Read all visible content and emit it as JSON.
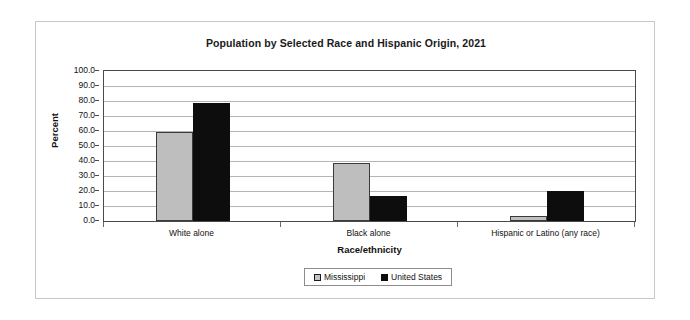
{
  "chart_data": {
    "type": "bar",
    "title": "Population by Selected Race and Hispanic Origin, 2021",
    "xlabel": "Race/ethnicity",
    "ylabel": "Percent",
    "ylim": [
      0.0,
      100.0
    ],
    "ytick_step": 10.0,
    "ytick_labels": [
      "100.0",
      "90.0",
      "80.0",
      "70.0",
      "60.0",
      "50.0",
      "40.0",
      "30.0",
      "20.0",
      "10.0",
      "0.0"
    ],
    "ytick_values": [
      100.0,
      90.0,
      80.0,
      70.0,
      60.0,
      50.0,
      40.0,
      30.0,
      20.0,
      10.0,
      0.0
    ],
    "grid": true,
    "legend_position": "bottom-center",
    "categories": [
      "White alone",
      "Black alone",
      "Hispanic or Latino (any race)"
    ],
    "series": [
      {
        "name": "Mississippi",
        "color": "#bebebe",
        "values": [
          59.1,
          38.8,
          3.6
        ]
      },
      {
        "name": "United States",
        "color": "#0d0d0d",
        "values": [
          79.0,
          16.9,
          19.9
        ]
      }
    ]
  }
}
